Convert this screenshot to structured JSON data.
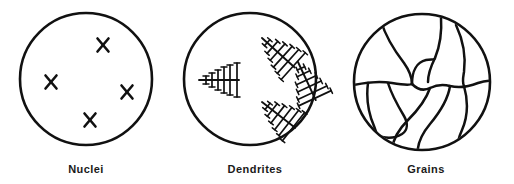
{
  "figure": {
    "background_color": "#ffffff",
    "line_color": "#111111",
    "width": 514,
    "height": 184
  },
  "panels": [
    {
      "id": "nuclei",
      "caption": "Nuclei",
      "circle": {
        "cx": 86,
        "cy": 79,
        "r": 66
      },
      "marks": [
        {
          "x": 103,
          "y": 45,
          "size": 7.5,
          "rotation": 8
        },
        {
          "x": 51,
          "y": 82,
          "size": 7.5,
          "rotation": -6
        },
        {
          "x": 127,
          "y": 92,
          "size": 7.5,
          "rotation": 10
        },
        {
          "x": 90,
          "y": 120,
          "size": 7.5,
          "rotation": -4
        }
      ]
    },
    {
      "id": "dendrites",
      "caption": "Dendrites",
      "circle": {
        "cx": 250,
        "cy": 79,
        "r": 66
      },
      "shapes": [
        {
          "tip_x": 199,
          "tip_y": 80,
          "length": 38,
          "angle": 0,
          "branches": 6
        },
        {
          "tip_x": 262,
          "tip_y": 38,
          "length": 44,
          "angle": 132,
          "branches": 6
        },
        {
          "tip_x": 298,
          "tip_y": 63,
          "length": 42,
          "angle": 118,
          "branches": 6
        },
        {
          "tip_x": 262,
          "tip_y": 103,
          "length": 42,
          "angle": 38,
          "branches": 6
        }
      ]
    },
    {
      "id": "grains",
      "caption": "Grains",
      "circle": {
        "cx": 422,
        "cy": 82,
        "r": 68
      },
      "boundary_count": 9
    }
  ]
}
